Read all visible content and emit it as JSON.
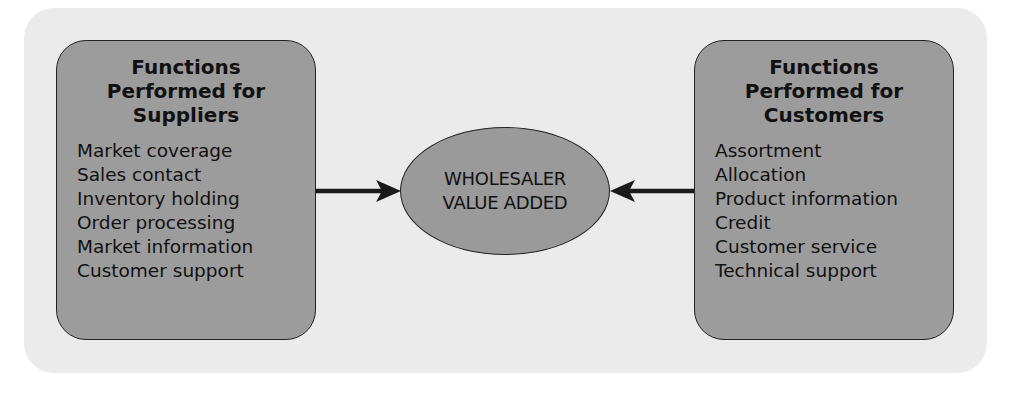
{
  "diagram": {
    "left_box": {
      "title_lines": [
        "Functions",
        "Performed for",
        "Suppliers"
      ],
      "items": [
        "Market coverage",
        "Sales contact",
        "Inventory holding",
        "Order processing",
        "Market information",
        "Customer support"
      ]
    },
    "center": {
      "lines": [
        "WHOLESALER",
        "VALUE ADDED"
      ]
    },
    "right_box": {
      "title_lines": [
        "Functions",
        "Performed for",
        "Customers"
      ],
      "items": [
        "Assortment",
        "Allocation",
        "Product information",
        "Credit",
        "Customer service",
        "Technical support"
      ]
    },
    "arrows": [
      {
        "from": "left_box",
        "to": "center",
        "direction": "right"
      },
      {
        "from": "right_box",
        "to": "center",
        "direction": "left"
      }
    ],
    "colors": {
      "background": "#ffffff",
      "panel": "#ebebeb",
      "box_fill": "#9c9c9c",
      "ellipse_fill": "#9a9a9a",
      "stroke": "#222222"
    }
  }
}
